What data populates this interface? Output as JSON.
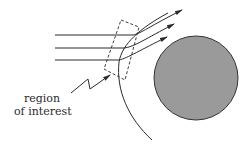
{
  "diagram": {
    "label_line1": "region",
    "label_line2": "of interest",
    "colors": {
      "stroke": "#2a2a2a",
      "circle_fill": "#9a9a9a",
      "circle_stroke": "#333333",
      "background": "#ffffff"
    },
    "elements": [
      {
        "type": "incoming-ray",
        "count": 3,
        "direction": "horizontal",
        "bends_at_boundary": true
      },
      {
        "type": "boundary-curve"
      },
      {
        "type": "dashed-box",
        "meaning": "region of interest"
      },
      {
        "type": "obstacle",
        "shape": "filled-circle"
      },
      {
        "type": "pointer-arrow",
        "style": "zigzag"
      }
    ]
  }
}
